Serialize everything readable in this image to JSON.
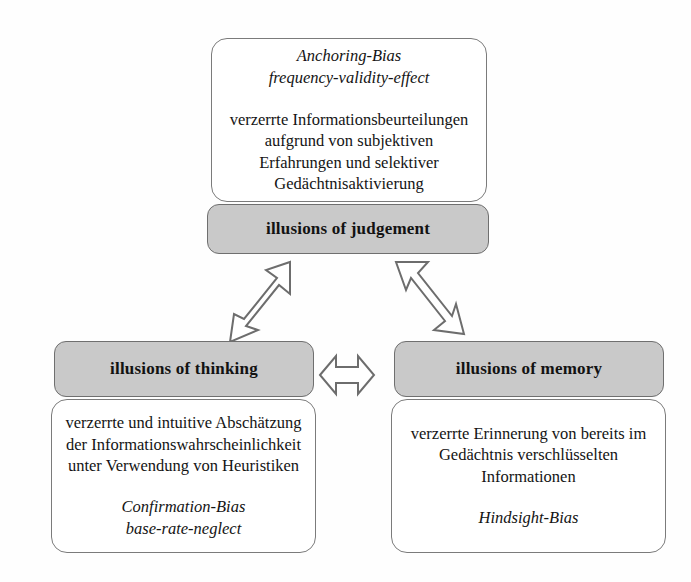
{
  "diagram": {
    "colors": {
      "header_fill": "#c9c9c9",
      "box_fill": "#ffffff",
      "border": "#6f6f6f",
      "text": "#121212",
      "background": "#ffffff"
    }
  },
  "top_node": {
    "detail": {
      "bias_line_1": "Anchoring-Bias",
      "bias_line_2": "frequency-validity-effect",
      "description_line_1": "verzerrte Informationsbeurteilungen",
      "description_line_2": "aufgrund von subjektiven",
      "description_line_3": "Erfahrungen  und selektiver",
      "description_line_4": "Gedächtnisaktivierung"
    },
    "header": {
      "label": "illusions of judgement"
    }
  },
  "left_node": {
    "header": {
      "label": "illusions of thinking"
    },
    "detail": {
      "description_line_1": "verzerrte und intuitive Abschätzung",
      "description_line_2": "der Informationswahrscheinlichkeit",
      "description_line_3": "unter Verwendung von Heuristiken",
      "bias_line_1": "Confirmation-Bias",
      "bias_line_2": "base-rate-neglect"
    }
  },
  "right_node": {
    "header": {
      "label": "illusions of memory"
    },
    "detail": {
      "description_line_1": "verzerrte Erinnerung von bereits im",
      "description_line_2": "Gedächtnis verschlüsselten",
      "description_line_3": "Informationen",
      "bias_line_1": "Hindsight-Bias"
    }
  },
  "connectors": [
    {
      "name": "judgement-thinking",
      "icon": "double-headed-diagonal-arrow-icon",
      "direction": "bidirectional",
      "from": "illusions of judgement",
      "to": "illusions of thinking"
    },
    {
      "name": "judgement-memory",
      "icon": "double-headed-diagonal-arrow-icon",
      "direction": "bidirectional",
      "from": "illusions of judgement",
      "to": "illusions of memory"
    },
    {
      "name": "thinking-memory",
      "icon": "double-headed-horizontal-arrow-icon",
      "direction": "bidirectional",
      "from": "illusions of thinking",
      "to": "illusions of memory"
    }
  ]
}
